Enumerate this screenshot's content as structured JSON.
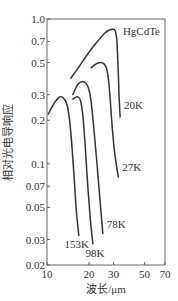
{
  "chart_data": {
    "type": "line",
    "title": "",
    "annotation": "HgCdTe",
    "xlabel": "波长/μm",
    "ylabel": "相对光电导响应",
    "xscale": "log",
    "yscale": "log",
    "xlim": [
      10,
      70
    ],
    "ylim": [
      0.02,
      1.0
    ],
    "xticks": [
      10,
      20,
      30,
      50,
      70
    ],
    "xtick_labels": [
      "10",
      "20",
      "30",
      "50",
      "70"
    ],
    "yticks": [
      1.0,
      0.7,
      0.5,
      0.3,
      0.2,
      0.1,
      0.07,
      0.05,
      0.03,
      0.02
    ],
    "ytick_labels": [
      "1.0",
      "0.7",
      "0.5",
      "0.3",
      "0.2",
      "0.1",
      "0.07",
      "0.05",
      "0.03",
      "0.02"
    ],
    "grid": false,
    "legend": "inline labels near curve ends",
    "series": [
      {
        "name": "20K",
        "x": [
          14.8,
          17.0,
          20.0,
          23.0,
          26.0,
          28.0,
          29.5,
          30.8,
          31.6,
          32.2,
          32.8,
          33.4
        ],
        "y": [
          0.39,
          0.47,
          0.59,
          0.7,
          0.8,
          0.84,
          0.85,
          0.83,
          0.72,
          0.5,
          0.3,
          0.21
        ]
      },
      {
        "name": "27K",
        "x": [
          20.7,
          22.5,
          24.3,
          25.6,
          26.6,
          27.4,
          28.2,
          29.3,
          30.5,
          32.4
        ],
        "y": [
          0.46,
          0.49,
          0.5,
          0.49,
          0.46,
          0.4,
          0.3,
          0.18,
          0.12,
          0.081
        ]
      },
      {
        "name": "78K",
        "x": [
          15.3,
          16.5,
          17.8,
          19.0,
          19.9,
          20.7,
          21.6,
          22.8,
          24.0,
          25.1
        ],
        "y": [
          0.3,
          0.35,
          0.37,
          0.36,
          0.33,
          0.27,
          0.18,
          0.1,
          0.055,
          0.033
        ]
      },
      {
        "name": "98K",
        "x": [
          15.3,
          16.4,
          17.2,
          17.7,
          18.2,
          18.8,
          19.6,
          20.5,
          21.3
        ],
        "y": [
          0.28,
          0.29,
          0.28,
          0.25,
          0.2,
          0.13,
          0.07,
          0.04,
          0.028
        ]
      },
      {
        "name": "153K",
        "x": [
          10.2,
          11.2,
          12.4,
          13.3,
          14.0,
          14.6,
          15.2,
          15.8,
          16.3,
          16.9
        ],
        "y": [
          0.22,
          0.26,
          0.29,
          0.28,
          0.25,
          0.19,
          0.12,
          0.07,
          0.045,
          0.032
        ]
      }
    ]
  }
}
